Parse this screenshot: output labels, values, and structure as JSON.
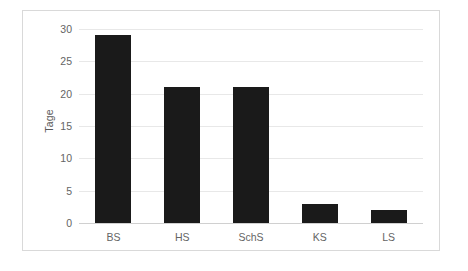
{
  "figure": {
    "caption": ""
  },
  "chart_data": {
    "type": "bar",
    "title": "",
    "xlabel": "",
    "ylabel": "Tage",
    "categories": [
      "BS",
      "HS",
      "SchS",
      "KS",
      "LS"
    ],
    "values": [
      29,
      21,
      21,
      3,
      2
    ],
    "ylim": [
      0,
      30
    ],
    "yticks": [
      0,
      5,
      10,
      15,
      20,
      25,
      30
    ],
    "ytick_labels": [
      "0",
      "5",
      "10",
      "15",
      "20",
      "25",
      "30"
    ],
    "grid": true,
    "legend": false,
    "bar_color": "#1a1a1a",
    "grid_color": "#e8e8e8",
    "frame_color": "#d9d9d9",
    "text_color": "#646464"
  }
}
